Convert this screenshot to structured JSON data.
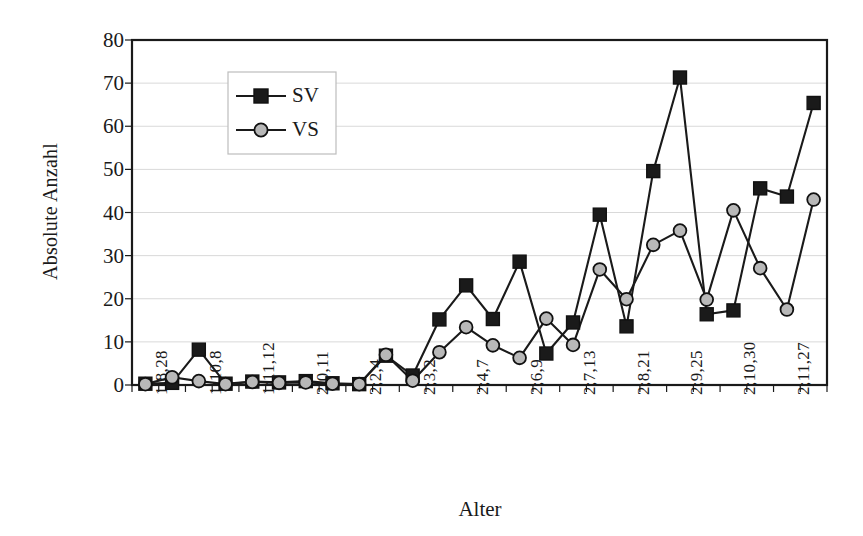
{
  "chart_data": {
    "type": "line",
    "title": "",
    "xlabel": "Alter",
    "ylabel": "Absolute Anzahl",
    "ylim": [
      0,
      80
    ],
    "ytick_values": [
      0,
      10,
      20,
      30,
      40,
      50,
      60,
      70,
      80
    ],
    "grid": true,
    "legend_position": "top-left-inside",
    "x_index": [
      1,
      2,
      3,
      4,
      5,
      6,
      7,
      8,
      9,
      10,
      11,
      12,
      13,
      14,
      15,
      16,
      17,
      18,
      19,
      20,
      21,
      22,
      23,
      24,
      25,
      26
    ],
    "categories": [
      "1;8,28",
      "",
      "1;10,8",
      "",
      "1;11,12",
      "",
      "2;0,11",
      "",
      "2;2,4",
      "",
      "2;3,2",
      "",
      "2;4,7",
      "",
      "2;6,9",
      "",
      "2;7,13",
      "",
      "2;8,21",
      "",
      "2;9,25",
      "",
      "2;10,30",
      "",
      "2;11,27",
      ""
    ],
    "tick_labels": [
      "1;8,28",
      "1;10,8",
      "1;11,12",
      "2;0,11",
      "2;2,4",
      "2;3,2",
      "2;4,7",
      "2;6,9",
      "2;7,13",
      "2;8,21",
      "2;9,25",
      "2;10,30",
      "2;11,27"
    ],
    "tick_label_indices": [
      1,
      3,
      5,
      7,
      9,
      11,
      13,
      15,
      17,
      19,
      21,
      23,
      25
    ],
    "series": [
      {
        "name": "SV",
        "marker": "square",
        "marker_color": "#1a1a1a",
        "line_color": "#1a1a1a",
        "values": [
          0.3,
          0.5,
          8.2,
          0.3,
          0.8,
          0.6,
          0.9,
          0.4,
          0.2,
          6.8,
          2.2,
          15.2,
          23.1,
          15.3,
          28.6,
          7.3,
          14.5,
          39.5,
          13.6,
          49.6,
          71.3,
          16.4,
          17.3,
          45.6,
          43.7,
          65.4
        ]
      },
      {
        "name": "VS",
        "marker": "circle",
        "marker_color": "#b8b8b8",
        "line_color": "#1a1a1a",
        "values": [
          0.2,
          1.8,
          0.9,
          0.2,
          0.7,
          0.5,
          0.6,
          0.3,
          0.2,
          7.0,
          1.0,
          7.6,
          13.4,
          9.2,
          6.3,
          15.4,
          9.3,
          26.8,
          19.9,
          32.5,
          35.8,
          19.8,
          40.5,
          27.1,
          17.5,
          43.0
        ]
      }
    ]
  },
  "legend": {
    "items": [
      {
        "label": "SV"
      },
      {
        "label": "VS"
      }
    ]
  },
  "colors": {
    "axis": "#1a1a1a",
    "grid": "#d9d9d9",
    "sv_marker": "#1a1a1a",
    "vs_marker": "#b8b8b8",
    "background": "#ffffff"
  }
}
